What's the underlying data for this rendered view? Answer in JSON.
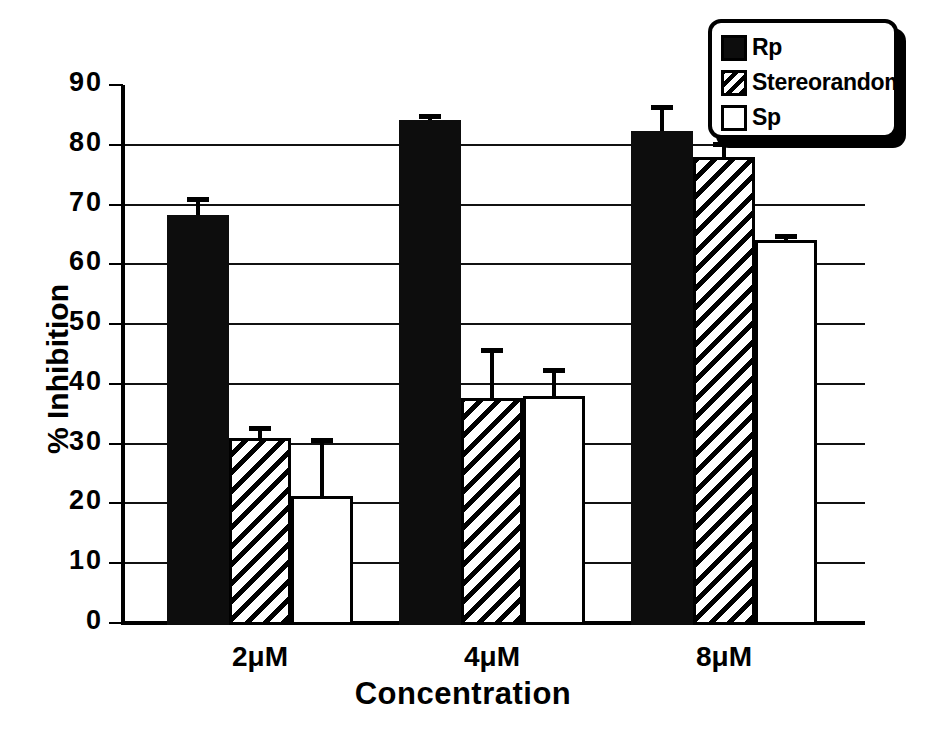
{
  "chart_data": {
    "type": "bar",
    "title": "",
    "xlabel": "Concentration",
    "ylabel": "% Inhibition",
    "categories": [
      "2μM",
      "4μM",
      "8μM"
    ],
    "ylim": [
      0,
      90
    ],
    "yticks": [
      0,
      10,
      20,
      30,
      40,
      50,
      60,
      70,
      80,
      90
    ],
    "ytick_labels": [
      "0",
      "10",
      "20",
      "30",
      "40",
      "50",
      "60",
      "70",
      "80",
      "90"
    ],
    "grid": true,
    "legend_position": "top-right",
    "series": [
      {
        "name": "Rp",
        "fill": "solid",
        "values": [
          68.3,
          84.2,
          82.3
        ],
        "errors": [
          3.0,
          0.9,
          4.4
        ]
      },
      {
        "name": "Stereorandom",
        "fill": "hatch",
        "values": [
          31.0,
          37.6,
          78.0
        ],
        "errors": [
          1.9,
          8.4,
          2.4
        ]
      },
      {
        "name": "Sp",
        "fill": "open",
        "values": [
          21.3,
          38.0,
          64.0
        ],
        "errors": [
          9.6,
          4.6,
          1.1
        ]
      }
    ]
  },
  "legend": {
    "items": [
      {
        "label": "Rp",
        "fill": "solid"
      },
      {
        "label": "Stereorandom",
        "fill": "hatch"
      },
      {
        "label": "Sp",
        "fill": "open"
      }
    ]
  }
}
